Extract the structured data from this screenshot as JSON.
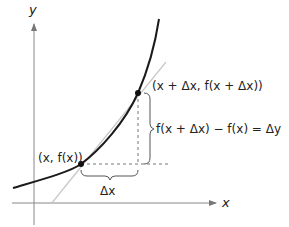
{
  "diagram": {
    "axes": {
      "x_label": "x",
      "y_label": "y"
    },
    "points": {
      "p1_label": "(x, f(x))",
      "p2_label": "(x + Δx, f(x + Δx))"
    },
    "brackets": {
      "horizontal_label": "Δx",
      "vertical_label": "f(x + Δx) − f(x) = Δy"
    },
    "colors": {
      "curve": "#1a1a1a",
      "axis": "#888888",
      "tangent": "#c8c8c8",
      "dashed": "#777777",
      "text": "#222222"
    }
  }
}
